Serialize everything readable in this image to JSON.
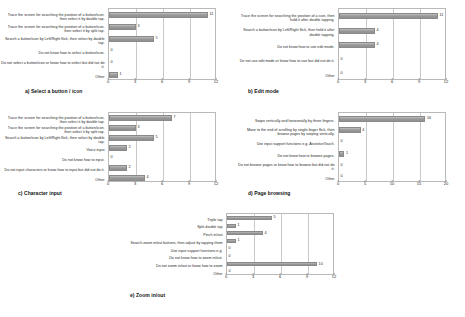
{
  "figure": {
    "panels": [
      {
        "id": "a",
        "caption": "a) Select a button / icon",
        "chart_data": {
          "type": "bar",
          "orientation": "horizontal",
          "title": "a) Select a button / icon",
          "xlabel": "",
          "ylabel": "",
          "xlim": [
            0,
            12
          ],
          "ticks": [
            0,
            3,
            6,
            9,
            12
          ],
          "grid": true,
          "legend": "none",
          "categories": [
            "Trace the screen for searching the position of a button/icon, then select it by double tap.",
            "Trace the screen for searching the position of a button/icon, then select it by split tap.",
            "Search a button/icon by Left/Right flick, then select by double tap.",
            "Do not know how to select a button/icon.",
            "Do not select a button/icon or know how to select but did not do it.",
            "Other"
          ],
          "values": [
            11,
            3,
            5,
            0,
            0,
            1
          ]
        }
      },
      {
        "id": "b",
        "caption": "b) Edit mode",
        "chart_data": {
          "type": "bar",
          "orientation": "horizontal",
          "title": "b) Edit mode",
          "xlabel": "",
          "ylabel": "",
          "xlim": [
            0,
            12
          ],
          "ticks": [
            0,
            3,
            6,
            9,
            12
          ],
          "grid": true,
          "legend": "none",
          "categories": [
            "Trace the screen for searching the position of a icon, then hold it after double tapping.",
            "Search a button/icon by Left/Right flick, then hold it after double tapping.",
            "Do not know how to use edit mode.",
            "Do not use edit mode or know how to use but did not do it.",
            "Other"
          ],
          "values": [
            11,
            4,
            4,
            0,
            0
          ]
        }
      },
      {
        "id": "c",
        "caption": "c) Character input",
        "chart_data": {
          "type": "bar",
          "orientation": "horizontal",
          "title": "c) Character input",
          "xlabel": "",
          "ylabel": "",
          "xlim": [
            0,
            12
          ],
          "ticks": [
            0,
            3,
            6,
            9,
            12
          ],
          "grid": true,
          "legend": "none",
          "categories": [
            "Trace the screen for searching the position of a button/icon, then select it by double tap.",
            "Trace the screen for searching the position of a button/icon, then select it by split tap.",
            "Search a button/icon by Left/Right flick, then select by double tap.",
            "Voice input",
            "Do not know how to input.",
            "Do not input characters or know how to input but did not do it.",
            "Other"
          ],
          "values": [
            7,
            3,
            5,
            2,
            0,
            2,
            4
          ]
        }
      },
      {
        "id": "d",
        "caption": "d) Page browsing",
        "chart_data": {
          "type": "bar",
          "orientation": "horizontal",
          "title": "d) Page browsing",
          "xlabel": "",
          "ylabel": "",
          "xlim": [
            0,
            20
          ],
          "ticks": [
            0,
            5,
            10,
            15,
            20
          ],
          "grid": true,
          "legend": "none",
          "categories": [
            "Swipe vertically and horizontally by three fingers.",
            "Move to the end of scrolling by single-finger flick, then browse pages by swiping vertically.",
            "Use input support functions e.g. AssistiveTouch.",
            "Do not know how to browse pages.",
            "Do not browse pages or know how to browse but did not do it.",
            "Other"
          ],
          "values": [
            16,
            4,
            0,
            1,
            0,
            0
          ]
        }
      },
      {
        "id": "e",
        "caption": "e) Zoom in/out",
        "chart_data": {
          "type": "bar",
          "orientation": "horizontal",
          "title": "e) Zoom in/out",
          "xlabel": "",
          "ylabel": "",
          "xlim": [
            0,
            12
          ],
          "ticks": [
            0,
            3,
            6,
            9,
            12
          ],
          "grid": true,
          "legend": "none",
          "categories": [
            "Triple tap",
            "Split double tap",
            "Pinch in/out",
            "Search zoom in/out buttons, then adjust by tapping them",
            "Use input support functions e.g.",
            "Do not know how to zoom in/out.",
            "Do not zoom in/out or know how to zoom",
            "Other"
          ],
          "values": [
            5,
            1,
            4,
            1,
            0,
            0,
            10,
            0
          ]
        }
      }
    ]
  }
}
